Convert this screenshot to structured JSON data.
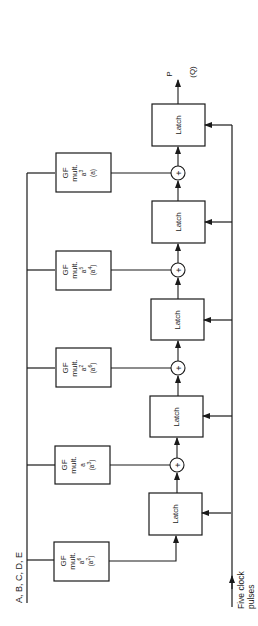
{
  "diagram": {
    "input_label": "A, B, C, D, E",
    "clock_label_line1": "Five clock",
    "clock_label_line2": "pulses",
    "output_label_p": "P",
    "output_label_q": "(Q)",
    "latch_label": "Latch",
    "xor_symbol": "+",
    "multipliers": [
      {
        "line1": "GF",
        "line2": "mult.",
        "coef": "a",
        "coef_exp": "3",
        "alt": "(a)",
        "alt_exp": ""
      },
      {
        "line1": "GF",
        "line2": "mult.",
        "coef": "a",
        "coef_exp": "5",
        "alt": "(a",
        "alt_exp": "4",
        "alt_close": ")"
      },
      {
        "line1": "GF",
        "line2": "mult.",
        "coef": "a",
        "coef_exp": "2",
        "alt": "(a",
        "alt_exp": "6",
        "alt_close": ")"
      },
      {
        "line1": "GF",
        "line2": "mult.",
        "coef": "a",
        "coef_exp": "",
        "alt": "(a",
        "alt_exp": "3",
        "alt_close": ")"
      },
      {
        "line1": "GF",
        "line2": "mult.",
        "coef": "a",
        "coef_exp": "6",
        "alt": "(a",
        "alt_exp": "2",
        "alt_close": ")"
      }
    ],
    "latches": [
      {
        "label": "Latch"
      },
      {
        "label": "Latch"
      },
      {
        "label": "Latch"
      },
      {
        "label": "Latch"
      },
      {
        "label": "Latch"
      }
    ],
    "colors": {
      "stroke": "#1a1a1a",
      "background": "#ffffff"
    }
  }
}
